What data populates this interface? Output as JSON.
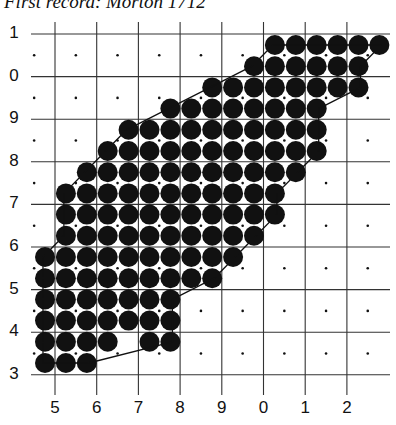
{
  "title": "First record: Morton 1712",
  "caption": "",
  "map": {
    "type": "tetrad distribution grid",
    "y_axis_labels": [
      "1",
      "0",
      "9",
      "8",
      "7",
      "6",
      "5",
      "4",
      "3"
    ],
    "x_axis_labels": [
      "5",
      "6",
      "7",
      "8",
      "9",
      "0",
      "1",
      "2"
    ],
    "grid": {
      "origin_x": 55,
      "cell_w": 41.7,
      "cols": 8,
      "origin_y": 34,
      "cell_h": 42.6,
      "rows": 8,
      "left_edge": 31,
      "right_edge": 390,
      "top_tick": 22,
      "bottom_tick": 395
    },
    "dot_grid": {
      "x0": 45,
      "dx": 20.9,
      "y0": 45,
      "dy": 21.2,
      "radius": 10
    },
    "occupied_rows": [
      {
        "row": 0,
        "from": 11,
        "to": 16
      },
      {
        "row": 1,
        "from": 10,
        "to": 15
      },
      {
        "row": 2,
        "from": 8,
        "to": 15
      },
      {
        "row": 3,
        "from": 6,
        "to": 13
      },
      {
        "row": 4,
        "from": 4,
        "to": 13
      },
      {
        "row": 5,
        "from": 3,
        "to": 13
      },
      {
        "row": 6,
        "from": 2,
        "to": 12
      },
      {
        "row": 7,
        "from": 1,
        "to": 11
      },
      {
        "row": 8,
        "from": 1,
        "to": 11
      },
      {
        "row": 9,
        "from": 1,
        "to": 10
      },
      {
        "row": 10,
        "from": 0,
        "to": 9
      },
      {
        "row": 11,
        "from": 0,
        "to": 8
      },
      {
        "row": 12,
        "from": 0,
        "to": 6
      },
      {
        "row": 13,
        "from": 0,
        "to": 6
      },
      {
        "row": 14,
        "from": 0,
        "to": 3
      },
      {
        "row": 14,
        "from": 5,
        "to": 6
      },
      {
        "row": 15,
        "from": 0,
        "to": 2
      }
    ],
    "colors": {
      "ink": "#111111",
      "grid": "#333333",
      "background": "#ffffff"
    }
  }
}
